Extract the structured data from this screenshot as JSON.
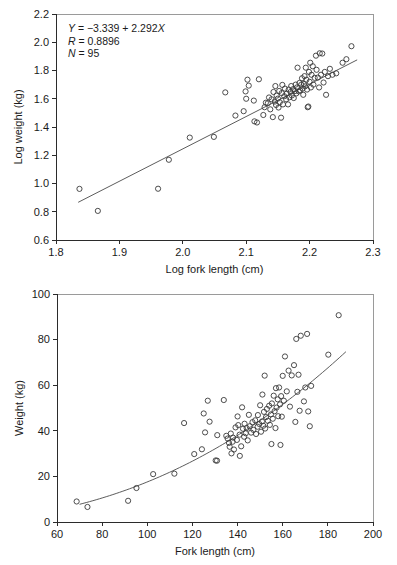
{
  "figure": {
    "panel_count": 2
  },
  "chart_data": [
    {
      "id": "log-log-regression",
      "type": "scatter",
      "title": "",
      "xlabel": "Log fork length (cm)",
      "ylabel": "Log weight (kg)",
      "xlim": [
        1.8,
        2.3
      ],
      "ylim": [
        0.6,
        2.2
      ],
      "xticks": [
        "1.8",
        "1.9",
        "2.0",
        "2.1",
        "2.2",
        "2.3"
      ],
      "xtick_values": [
        1.8,
        1.9,
        2.0,
        2.1,
        2.2,
        2.3
      ],
      "yticks": [
        "0.6",
        "0.8",
        "1.0",
        "1.2",
        "1.4",
        "1.6",
        "1.8",
        "2.0",
        "2.2"
      ],
      "ytick_values": [
        0.6,
        0.8,
        1.0,
        1.2,
        1.4,
        1.6,
        1.8,
        2.0,
        2.2
      ],
      "grid": false,
      "legend": "none",
      "annotation": {
        "equation": "Y = −3.339 + 2.292X",
        "equation_y": "Y",
        "equation_rest": " = −3.339 + 2.292",
        "equation_x": "X",
        "r_symbol": "R",
        "r_text": " = 0.8896",
        "n_symbol": "N",
        "n_text": " = 95",
        "intercept": -3.339,
        "slope": 2.292,
        "r": 0.8896,
        "n": 95
      },
      "fit": {
        "kind": "line",
        "x_start": 1.835,
        "x_end": 2.275,
        "slope": 2.292,
        "intercept": -3.339
      },
      "points": [
        [
          1.837,
          0.962
        ],
        [
          1.866,
          0.806
        ],
        [
          1.961,
          0.963
        ],
        [
          1.978,
          1.168
        ],
        [
          2.011,
          1.325
        ],
        [
          2.049,
          1.33
        ],
        [
          2.067,
          1.645
        ],
        [
          2.083,
          1.481
        ],
        [
          2.096,
          1.512
        ],
        [
          2.099,
          1.652
        ],
        [
          2.1,
          1.6
        ],
        [
          2.102,
          1.735
        ],
        [
          2.104,
          1.693
        ],
        [
          2.112,
          1.587
        ],
        [
          2.113,
          1.44
        ],
        [
          2.117,
          1.432
        ],
        [
          2.12,
          1.738
        ],
        [
          2.127,
          1.485
        ],
        [
          2.129,
          1.54
        ],
        [
          2.131,
          1.572
        ],
        [
          2.134,
          1.568
        ],
        [
          2.136,
          1.609
        ],
        [
          2.138,
          1.525
        ],
        [
          2.14,
          1.596
        ],
        [
          2.142,
          1.47
        ],
        [
          2.143,
          1.648
        ],
        [
          2.145,
          1.58
        ],
        [
          2.146,
          1.69
        ],
        [
          2.147,
          1.556
        ],
        [
          2.148,
          1.622
        ],
        [
          2.15,
          1.601
        ],
        [
          2.151,
          1.538
        ],
        [
          2.152,
          1.655
        ],
        [
          2.153,
          1.575
        ],
        [
          2.155,
          1.466
        ],
        [
          2.156,
          1.64
        ],
        [
          2.157,
          1.698
        ],
        [
          2.158,
          1.56
        ],
        [
          2.16,
          1.618
        ],
        [
          2.161,
          1.672
        ],
        [
          2.163,
          1.596
        ],
        [
          2.164,
          1.636
        ],
        [
          2.166,
          1.56
        ],
        [
          2.167,
          1.665
        ],
        [
          2.168,
          1.61
        ],
        [
          2.17,
          1.648
        ],
        [
          2.171,
          1.69
        ],
        [
          2.172,
          1.623
        ],
        [
          2.174,
          1.668
        ],
        [
          2.175,
          1.605
        ],
        [
          2.177,
          1.655
        ],
        [
          2.178,
          1.7
        ],
        [
          2.179,
          1.638
        ],
        [
          2.18,
          1.68
        ],
        [
          2.181,
          1.82
        ],
        [
          2.183,
          1.652
        ],
        [
          2.184,
          1.712
        ],
        [
          2.185,
          1.66
        ],
        [
          2.187,
          1.7
        ],
        [
          2.188,
          1.745
        ],
        [
          2.189,
          1.672
        ],
        [
          2.19,
          1.628
        ],
        [
          2.191,
          1.705
        ],
        [
          2.192,
          1.76
        ],
        [
          2.193,
          1.688
        ],
        [
          2.194,
          1.82
        ],
        [
          2.195,
          1.735
        ],
        [
          2.196,
          1.665
        ],
        [
          2.197,
          1.54
        ],
        [
          2.198,
          1.545
        ],
        [
          2.199,
          1.79
        ],
        [
          2.2,
          1.72
        ],
        [
          2.201,
          1.855
        ],
        [
          2.202,
          1.68
        ],
        [
          2.203,
          1.77
        ],
        [
          2.205,
          1.83
        ],
        [
          2.206,
          1.7
        ],
        [
          2.208,
          1.748
        ],
        [
          2.21,
          1.905
        ],
        [
          2.211,
          1.805
        ],
        [
          2.213,
          1.75
        ],
        [
          2.215,
          1.68
        ],
        [
          2.216,
          1.922
        ],
        [
          2.218,
          1.77
        ],
        [
          2.22,
          1.92
        ],
        [
          2.222,
          1.715
        ],
        [
          2.224,
          1.79
        ],
        [
          2.226,
          1.628
        ],
        [
          2.229,
          1.76
        ],
        [
          2.232,
          1.812
        ],
        [
          2.236,
          1.77
        ],
        [
          2.242,
          1.78
        ],
        [
          2.252,
          1.855
        ],
        [
          2.258,
          1.88
        ],
        [
          2.266,
          1.972
        ]
      ]
    },
    {
      "id": "length-weight-power",
      "type": "scatter",
      "title": "",
      "xlabel": "Fork length (cm)",
      "ylabel": "Weight (kg)",
      "xlim": [
        60,
        200
      ],
      "ylim": [
        0,
        100
      ],
      "xticks": [
        "60",
        "80",
        "100",
        "120",
        "140",
        "160",
        "180",
        "200"
      ],
      "xtick_values": [
        60,
        80,
        100,
        120,
        140,
        160,
        180,
        200
      ],
      "yticks": [
        "0",
        "20",
        "40",
        "60",
        "80",
        "100"
      ],
      "ytick_values": [
        0,
        20,
        40,
        60,
        80,
        100
      ],
      "grid": false,
      "legend": "none",
      "fit": {
        "kind": "power",
        "x_start": 70,
        "x_end": 188,
        "coefficient": 0.000458,
        "exponent": 2.292
      },
      "points": [
        [
          68.7,
          9.0
        ],
        [
          73.5,
          6.6
        ],
        [
          91.5,
          9.3
        ],
        [
          95.2,
          14.9
        ],
        [
          102.6,
          21.0
        ],
        [
          112.0,
          21.2
        ],
        [
          116.3,
          43.4
        ],
        [
          120.8,
          29.8
        ],
        [
          124.2,
          31.9
        ],
        [
          125.0,
          47.6
        ],
        [
          125.6,
          39.3
        ],
        [
          126.8,
          53.2
        ],
        [
          127.6,
          44.0
        ],
        [
          130.3,
          27.0
        ],
        [
          130.9,
          26.9
        ],
        [
          131.0,
          38.1
        ],
        [
          133.9,
          53.5
        ],
        [
          135.0,
          37.8
        ],
        [
          135.6,
          36.6
        ],
        [
          136.2,
          34.7
        ],
        [
          136.5,
          33.0
        ],
        [
          137.0,
          38.8
        ],
        [
          137.3,
          30.1
        ],
        [
          137.8,
          35.2
        ],
        [
          138.0,
          37.0
        ],
        [
          138.4,
          31.8
        ],
        [
          139.1,
          41.5
        ],
        [
          139.7,
          36.0
        ],
        [
          140.0,
          46.3
        ],
        [
          140.3,
          42.5
        ],
        [
          140.9,
          38.3
        ],
        [
          141.0,
          29.0
        ],
        [
          141.6,
          33.2
        ],
        [
          142.0,
          50.3
        ],
        [
          142.4,
          40.9
        ],
        [
          142.9,
          37.4
        ],
        [
          143.1,
          43.1
        ],
        [
          143.6,
          38.9
        ],
        [
          144.0,
          41.2
        ],
        [
          144.5,
          35.8
        ],
        [
          145.0,
          47.0
        ],
        [
          145.4,
          42.0
        ],
        [
          146.0,
          39.2
        ],
        [
          146.6,
          43.8
        ],
        [
          147.0,
          40.4
        ],
        [
          147.8,
          44.6
        ],
        [
          148.2,
          38.6
        ],
        [
          148.9,
          41.8
        ],
        [
          149.0,
          46.9
        ],
        [
          149.6,
          43.0
        ],
        [
          150.0,
          51.2
        ],
        [
          150.4,
          39.6
        ],
        [
          150.8,
          44.1
        ],
        [
          151.0,
          55.9
        ],
        [
          151.4,
          42.2
        ],
        [
          151.7,
          48.3
        ],
        [
          152.0,
          64.2
        ],
        [
          152.2,
          41.0
        ],
        [
          152.6,
          46.0
        ],
        [
          153.0,
          49.6
        ],
        [
          153.4,
          44.4
        ],
        [
          154.0,
          51.0
        ],
        [
          154.3,
          42.6
        ],
        [
          154.8,
          47.2
        ],
        [
          155.0,
          34.2
        ],
        [
          155.2,
          52.0
        ],
        [
          155.6,
          45.3
        ],
        [
          156.0,
          55.4
        ],
        [
          156.4,
          48.6
        ],
        [
          156.8,
          41.2
        ],
        [
          157.0,
          58.7
        ],
        [
          157.3,
          50.2
        ],
        [
          157.8,
          53.8
        ],
        [
          158.0,
          46.4
        ],
        [
          158.4,
          59.0
        ],
        [
          158.8,
          51.6
        ],
        [
          159.0,
          33.8
        ],
        [
          159.3,
          55.2
        ],
        [
          159.6,
          46.2
        ],
        [
          160.0,
          64.1
        ],
        [
          160.5,
          53.2
        ],
        [
          161.0,
          72.6
        ],
        [
          161.8,
          57.3
        ],
        [
          162.6,
          66.4
        ],
        [
          163.2,
          50.6
        ],
        [
          164.0,
          64.3
        ],
        [
          165.0,
          68.8
        ],
        [
          165.6,
          43.9
        ],
        [
          166.0,
          80.3
        ],
        [
          166.5,
          57.1
        ],
        [
          167.0,
          64.6
        ],
        [
          167.5,
          48.8
        ],
        [
          168.0,
          81.7
        ],
        [
          169.4,
          52.9
        ],
        [
          170.0,
          59.0
        ],
        [
          170.8,
          82.5
        ],
        [
          171.3,
          48.5
        ],
        [
          172.0,
          42.0
        ],
        [
          172.6,
          59.7
        ],
        [
          180.2,
          73.4
        ],
        [
          184.8,
          90.7
        ]
      ]
    }
  ]
}
